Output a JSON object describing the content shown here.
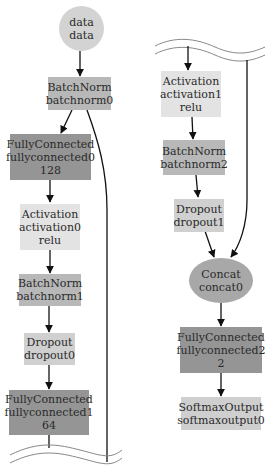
{
  "diagram": {
    "type": "neural-network-graph",
    "colors": {
      "input": "#d3d3d3",
      "batchnorm": "#b8b8b8",
      "fullyconnected": "#959595",
      "activation": "#e3e3e3",
      "dropout": "#d0d0d0",
      "concat": "#a8a8a8",
      "softmax": "#cfcfcf",
      "edge": "#111111"
    },
    "nodes": {
      "data": {
        "op": "data",
        "name": "data"
      },
      "batchnorm0": {
        "op": "BatchNorm",
        "name": "batchnorm0"
      },
      "fullyconnected0": {
        "op": "FullyConnected",
        "name": "fullyconnected0",
        "param": "128"
      },
      "activation0": {
        "op": "Activation",
        "name": "activation0",
        "param": "relu"
      },
      "batchnorm1": {
        "op": "BatchNorm",
        "name": "batchnorm1"
      },
      "dropout0": {
        "op": "Dropout",
        "name": "dropout0"
      },
      "fullyconnected1": {
        "op": "FullyConnected",
        "name": "fullyconnected1",
        "param": "64"
      },
      "activation1": {
        "op": "Activation",
        "name": "activation1",
        "param": "relu"
      },
      "batchnorm2": {
        "op": "BatchNorm",
        "name": "batchnorm2"
      },
      "dropout1": {
        "op": "Dropout",
        "name": "dropout1"
      },
      "concat0": {
        "op": "Concat",
        "name": "concat0"
      },
      "fullyconnected2": {
        "op": "FullyConnected",
        "name": "fullyconnected2",
        "param": "2"
      },
      "softmaxoutput0": {
        "op": "SoftmaxOutput",
        "name": "softmaxoutput0"
      }
    },
    "edges": [
      [
        "data",
        "batchnorm0"
      ],
      [
        "batchnorm0",
        "fullyconnected0"
      ],
      [
        "fullyconnected0",
        "activation0"
      ],
      [
        "activation0",
        "batchnorm1"
      ],
      [
        "batchnorm1",
        "dropout0"
      ],
      [
        "dropout0",
        "fullyconnected1"
      ],
      [
        "fullyconnected1",
        "activation1"
      ],
      [
        "activation1",
        "batchnorm2"
      ],
      [
        "batchnorm2",
        "dropout1"
      ],
      [
        "dropout1",
        "concat0"
      ],
      [
        "batchnorm0",
        "concat0"
      ],
      [
        "concat0",
        "fullyconnected2"
      ],
      [
        "fullyconnected2",
        "softmaxoutput0"
      ]
    ]
  }
}
